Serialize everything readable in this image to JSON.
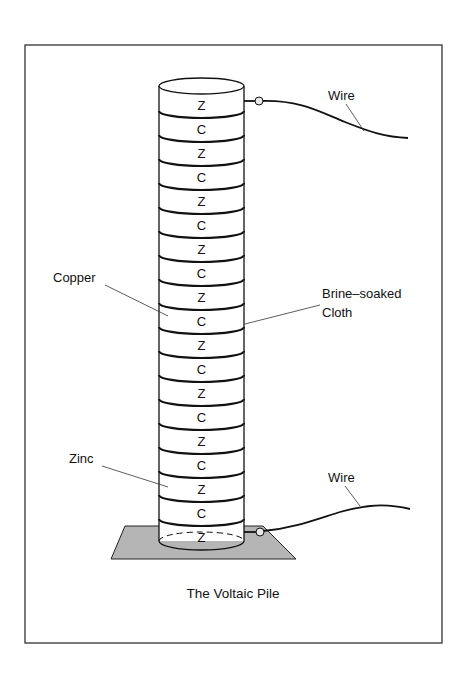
{
  "diagram": {
    "caption": "The Voltaic Pile",
    "frame": {
      "x": 25,
      "y": 45,
      "width": 417,
      "height": 598
    },
    "pile": {
      "left_x": 159,
      "right_x": 244,
      "top_ellipse_cy": 86,
      "first_letter_y": 105,
      "disc_spacing": 24,
      "discs": [
        "Z",
        "C",
        "Z",
        "C",
        "Z",
        "C",
        "Z",
        "C",
        "Z",
        "C",
        "Z",
        "C",
        "Z",
        "C",
        "Z",
        "C",
        "Z",
        "C",
        "Z"
      ]
    },
    "base_plate": {
      "color": "#b5b5b5",
      "points": [
        [
          125,
          526
        ],
        [
          263,
          526
        ],
        [
          296,
          559
        ],
        [
          111,
          559
        ]
      ]
    },
    "labels": {
      "copper": "Copper",
      "brine_line1": "Brine–soaked",
      "brine_line2": "Cloth",
      "zinc": "Zinc",
      "wire_top": "Wire",
      "wire_bottom": "Wire"
    },
    "colors": {
      "line": "#111111",
      "plate": "#b5b5b5",
      "background": "#ffffff"
    }
  }
}
